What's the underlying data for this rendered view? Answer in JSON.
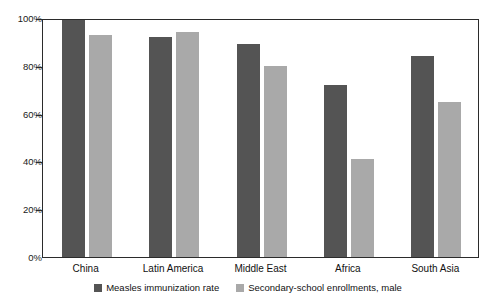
{
  "top_strip_text": "",
  "chart_data": {
    "type": "bar",
    "title": "",
    "xlabel": "",
    "ylabel": "",
    "ylim": [
      0,
      100
    ],
    "yticks": [
      0,
      20,
      40,
      60,
      80,
      100
    ],
    "ytick_labels": [
      "0%",
      "20%",
      "40%",
      "60%",
      "80%",
      "100%"
    ],
    "grid": false,
    "legend_position": "bottom-center",
    "categories": [
      "China",
      "Latin America",
      "Middle East",
      "Africa",
      "South Asia"
    ],
    "series": [
      {
        "name": "Measles immunization rate",
        "color": "#545454",
        "values": [
          99,
          92,
          89,
          72,
          84
        ]
      },
      {
        "name": "Secondary-school enrollments, male",
        "color": "#a9a9a9",
        "values": [
          93,
          94,
          80,
          41,
          65
        ]
      }
    ]
  },
  "axis": {
    "tick_color": "#2b2b2b",
    "frame_color": "#2b2b2b"
  }
}
